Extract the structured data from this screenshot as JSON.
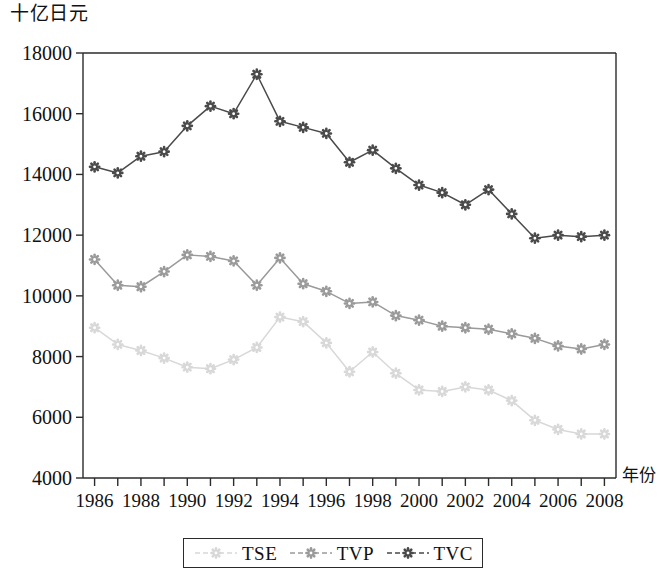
{
  "axis_titles": {
    "y_unit": "十亿日元",
    "x_caption": "年份"
  },
  "legend": {
    "entries": [
      {
        "label": "TSE",
        "color": "#d8d8d8"
      },
      {
        "label": "TVP",
        "color": "#9a9a9a"
      },
      {
        "label": "TVC",
        "color": "#4a4a4a"
      }
    ]
  },
  "chart_data": {
    "type": "line",
    "title": "",
    "subtitle": "",
    "xlabel": "年份",
    "ylabel": "十亿日元",
    "xlim": [
      1985.5,
      2008.5
    ],
    "ylim": [
      4000,
      18000
    ],
    "ytick_step": 2000,
    "ytick_labels": [
      "4000",
      "6000",
      "8000",
      "10000",
      "12000",
      "14000",
      "16000",
      "18000"
    ],
    "ytick_values": [
      4000,
      6000,
      8000,
      10000,
      12000,
      14000,
      16000,
      18000
    ],
    "xtick_labels": [
      "1986",
      "1988",
      "1990",
      "1992",
      "1994",
      "1996",
      "1998",
      "2000",
      "2002",
      "2004",
      "2006",
      "2008"
    ],
    "xtick_values": [
      1986,
      1988,
      1990,
      1992,
      1994,
      1996,
      1998,
      2000,
      2002,
      2004,
      2006,
      2008
    ],
    "x_minor_ticks": [
      1986,
      1987,
      1988,
      1989,
      1990,
      1991,
      1992,
      1993,
      1994,
      1995,
      1996,
      1997,
      1998,
      1999,
      2000,
      2001,
      2002,
      2003,
      2004,
      2005,
      2006,
      2007,
      2008
    ],
    "grid": false,
    "legend_position": "bottom",
    "x": [
      1986,
      1987,
      1988,
      1989,
      1990,
      1991,
      1992,
      1993,
      1994,
      1995,
      1996,
      1997,
      1998,
      1999,
      2000,
      2001,
      2002,
      2003,
      2004,
      2005,
      2006,
      2007,
      2008
    ],
    "series": [
      {
        "name": "TVC",
        "color": "#4a4a4a",
        "marker": "circle",
        "values": [
          14250,
          14050,
          14600,
          14750,
          15600,
          16250,
          16000,
          17300,
          15750,
          15550,
          15350,
          14400,
          14800,
          14200,
          13650,
          13400,
          13000,
          13500,
          12700,
          11900,
          12000,
          11950,
          12000
        ]
      },
      {
        "name": "TVP",
        "color": "#9a9a9a",
        "marker": "circle",
        "values": [
          11200,
          10350,
          10300,
          10800,
          11350,
          11300,
          11150,
          10350,
          11250,
          10400,
          10150,
          9750,
          9800,
          9350,
          9200,
          9000,
          8950,
          8900,
          8750,
          8600,
          8350,
          8250,
          8400
        ]
      },
      {
        "name": "TSE",
        "color": "#d8d8d8",
        "marker": "circle",
        "values": [
          8950,
          8400,
          8200,
          7950,
          7650,
          7600,
          7900,
          8300,
          9300,
          9150,
          8450,
          7500,
          8150,
          7450,
          6900,
          6850,
          7000,
          6900,
          6550,
          5900,
          5600,
          5450,
          5450
        ]
      }
    ]
  }
}
